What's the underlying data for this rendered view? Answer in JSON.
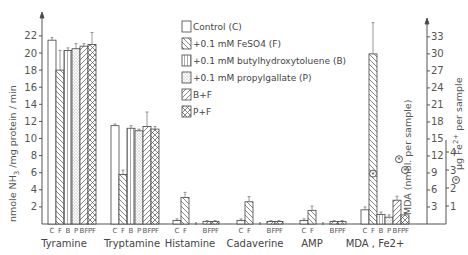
{
  "chart_data": {
    "type": "bar",
    "title": "",
    "ylabel": "nmole NH3 /mg protein / min",
    "ylabel_right": "MDA (nmol per sample)",
    "ylabel_right2": "µg Fe2+ per sample",
    "ylim": [
      0,
      23
    ],
    "ylim_right": [
      0,
      34
    ],
    "ylim_right2": [
      0,
      5.6
    ],
    "yticks": [
      2,
      4,
      6,
      8,
      10,
      12,
      14,
      16,
      18,
      20,
      22
    ],
    "yticks_right": [
      3,
      6,
      9,
      12,
      15,
      18,
      21,
      24,
      27,
      30,
      33
    ],
    "yticks_right2": [
      1,
      2,
      3,
      4
    ],
    "categories": [
      "Tyramine",
      "Tryptamine",
      "Histamine",
      "Cadaverine",
      "AMP",
      "MDA , Fe2+"
    ],
    "bar_labels": [
      [
        "C",
        "F",
        "B",
        "P",
        "BF",
        "PF"
      ],
      [
        "C",
        "F",
        "B",
        "P",
        "BF",
        "PF"
      ],
      [
        "C",
        "F",
        "BF",
        "PF"
      ],
      [
        "C",
        "F",
        "BF",
        "PF"
      ],
      [
        "C",
        "F",
        "BF",
        "PF"
      ],
      [
        "C",
        "F",
        "B",
        "P",
        "BF",
        "PF"
      ]
    ],
    "series": [
      {
        "name": "Control (C)",
        "key": "C",
        "values": [
          21.5,
          11.5,
          0.4,
          0.4,
          0.4,
          2.5
        ]
      },
      {
        "name": "+0.1 mM FeSO4 (F)",
        "key": "F",
        "values": [
          18.0,
          5.8,
          3.1,
          2.6,
          1.6,
          30.0
        ]
      },
      {
        "name": "+0.1 mM butylhydroxytoluene (B)",
        "key": "B",
        "values": [
          20.3,
          11.2,
          null,
          null,
          null,
          1.7
        ]
      },
      {
        "name": "+0.1 mM propylgallate (P)",
        "key": "P",
        "values": [
          20.5,
          10.9,
          null,
          null,
          null,
          1.2
        ]
      },
      {
        "name": "B+F",
        "key": "BF",
        "values": [
          20.8,
          11.4,
          0.3,
          0.3,
          0.3,
          4.2
        ]
      },
      {
        "name": "P+F",
        "key": "PF",
        "values": [
          21.0,
          11.1,
          0.3,
          0.3,
          0.3,
          1.6
        ]
      }
    ],
    "error_bars": {
      "C": [
        0.3,
        0.2,
        0.2,
        0.2,
        0.2,
        0.5
      ],
      "F": [
        2.3,
        0.5,
        0.6,
        0.6,
        0.5,
        5.5
      ],
      "B": [
        0.3,
        0.3,
        null,
        null,
        null,
        0.4
      ],
      "P": [
        0.6,
        0.2,
        null,
        null,
        null,
        0.4
      ],
      "BF": [
        0.3,
        1.7,
        0.1,
        0.1,
        0.1,
        0.7
      ],
      "PF": [
        1.4,
        0.3,
        0.1,
        0.1,
        0.1,
        0.4
      ]
    },
    "fe_markers": {
      "axis": "right2",
      "points": [
        {
          "bar": "F",
          "value": 2.8
        },
        {
          "bar": "BF",
          "value": 3.6
        },
        {
          "bar": "PF",
          "value": 3.0
        }
      ]
    },
    "legend_position": "top-center",
    "grid": false
  },
  "legend": [
    {
      "label": "Control (C)",
      "pattern": "none"
    },
    {
      "label": "+0.1 mM FeSO4 (F)",
      "pattern": "diag-back"
    },
    {
      "label": "+0.1 mM butylhydroxytoluene (B)",
      "pattern": "vertical"
    },
    {
      "label": "+0.1 mM propylgallate (P)",
      "pattern": "dots"
    },
    {
      "label": "B+F",
      "pattern": "diag-fwd"
    },
    {
      "label": "P+F",
      "pattern": "cross"
    }
  ],
  "labels": {
    "left_axis": "nmole NH",
    "left_axis_sub": "3",
    "left_axis_rest": " /mg protein / min",
    "right_axis": "MDA (nmol. per sample)",
    "right_axis2_pre": "µg Fe",
    "right_axis2_sup": "2+",
    "right_axis2_post": " per sample"
  }
}
